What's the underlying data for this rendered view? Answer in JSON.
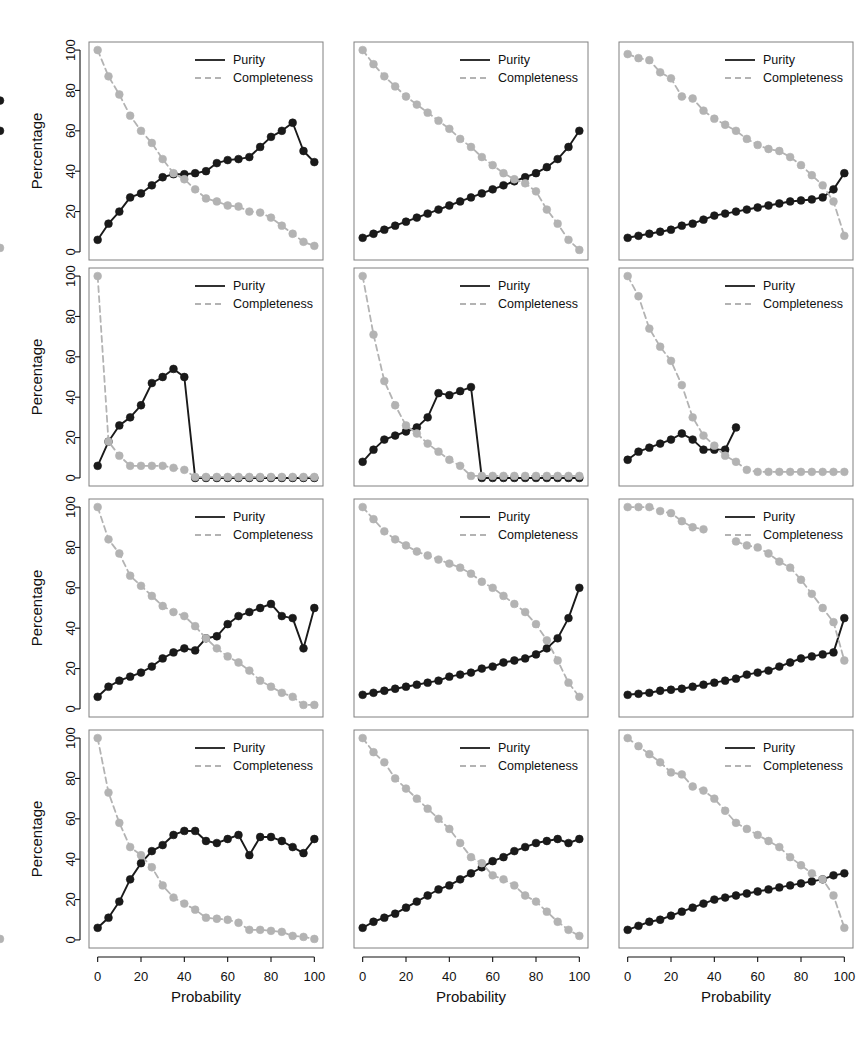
{
  "figure": {
    "rows": 4,
    "cols": 3,
    "shared_ylabel": "Percentage",
    "shared_xlabel": "Probability",
    "legend": {
      "purity_label": "Purity",
      "completeness_label": "Completeness",
      "purity_color": "#1a1a1a",
      "completeness_color": "#b3b3b3",
      "purity_style": "solid",
      "completeness_style": "dashed"
    },
    "axis": {
      "x_ticks": [
        0,
        20,
        40,
        60,
        80,
        100
      ],
      "y_ticks": [
        0,
        20,
        40,
        60,
        80,
        100
      ],
      "xlim": [
        -4,
        104
      ],
      "ylim": [
        -4,
        104
      ],
      "grid": false
    },
    "colors": {
      "background": "#ffffff",
      "frame": "#808080",
      "text": "#111111",
      "purity": "#1a1a1a",
      "completeness": "#b3b3b3"
    }
  },
  "chart_data": [
    {
      "type": "line",
      "panel": 1,
      "row": 1,
      "col": 1,
      "title": "",
      "xlabel": "",
      "ylabel": "Percentage",
      "xlim": [
        -4,
        104
      ],
      "ylim": [
        -4,
        104
      ],
      "x": [
        0,
        5,
        10,
        15,
        20,
        25,
        30,
        35,
        40,
        45,
        50,
        55,
        60,
        65,
        70,
        75,
        80,
        85,
        90,
        95,
        100
      ],
      "series": [
        {
          "name": "Purity",
          "values": [
            6,
            14,
            20,
            27,
            29,
            33,
            37,
            38.5,
            38.5,
            39,
            40,
            44,
            45.5,
            46,
            47,
            52,
            57,
            60,
            64,
            50,
            44.5,
            60
          ]
        },
        {
          "name": "Completeness",
          "values": [
            100,
            87,
            78,
            67.5,
            60,
            54,
            46,
            39,
            36,
            31,
            26.5,
            25,
            23,
            22.5,
            20,
            19.5,
            17,
            13,
            9,
            5,
            3,
            2
          ]
        }
      ],
      "legend_position": "top-right"
    },
    {
      "type": "line",
      "panel": 2,
      "row": 1,
      "col": 2,
      "title": "",
      "xlabel": "",
      "ylabel": "",
      "xlim": [
        -4,
        104
      ],
      "ylim": [
        -4,
        104
      ],
      "x": [
        0,
        5,
        10,
        15,
        20,
        25,
        30,
        35,
        40,
        45,
        50,
        55,
        60,
        65,
        70,
        75,
        80,
        85,
        90,
        95,
        100
      ],
      "series": [
        {
          "name": "Purity",
          "values": [
            7,
            9,
            11,
            13,
            15,
            17,
            19,
            21,
            23,
            25,
            27,
            29,
            31,
            33,
            35,
            37,
            39,
            42,
            46,
            52,
            60
          ]
        },
        {
          "name": "Completeness",
          "values": [
            100,
            93,
            87,
            82,
            77,
            73,
            69,
            65,
            61,
            56,
            52,
            47,
            43,
            39,
            36,
            34,
            30,
            21,
            14,
            6,
            1
          ]
        }
      ],
      "legend_position": "top-right"
    },
    {
      "type": "line",
      "panel": 3,
      "row": 1,
      "col": 3,
      "title": "",
      "xlabel": "",
      "ylabel": "",
      "xlim": [
        -4,
        104
      ],
      "ylim": [
        -4,
        104
      ],
      "x": [
        0,
        5,
        10,
        15,
        20,
        25,
        30,
        35,
        40,
        45,
        50,
        55,
        60,
        65,
        70,
        75,
        80,
        85,
        90,
        95,
        100
      ],
      "series": [
        {
          "name": "Purity",
          "values": [
            7,
            8,
            9,
            10,
            11,
            13,
            14,
            16,
            18,
            19,
            20,
            21,
            22,
            23,
            24,
            25,
            25.5,
            26,
            27,
            31,
            39,
            75
          ]
        },
        {
          "name": "Completeness",
          "values": [
            98,
            96,
            95,
            89,
            86,
            77,
            76,
            70,
            66,
            63,
            60,
            56,
            53,
            51,
            50,
            47,
            43,
            38,
            33,
            25,
            8
          ]
        }
      ],
      "legend_position": "top-right"
    },
    {
      "type": "line",
      "panel": 4,
      "row": 2,
      "col": 1,
      "title": "",
      "xlabel": "",
      "ylabel": "Percentage",
      "xlim": [
        -4,
        104
      ],
      "ylim": [
        -4,
        104
      ],
      "x": [
        0,
        5,
        10,
        15,
        20,
        25,
        30,
        35,
        40,
        45,
        50,
        55,
        60,
        65,
        70,
        75,
        80,
        85,
        90,
        95,
        100
      ],
      "series": [
        {
          "name": "Purity",
          "values": [
            6,
            18,
            26,
            30,
            36,
            47,
            50,
            54,
            50,
            0,
            0,
            0,
            0,
            0,
            0,
            0,
            0,
            0,
            0,
            0,
            0
          ]
        },
        {
          "name": "Completeness",
          "values": [
            100,
            18,
            11,
            6,
            6,
            6,
            6,
            5,
            4,
            0.5,
            0.5,
            0.5,
            0.5,
            0.5,
            0.5,
            0.5,
            0.5,
            0.5,
            0.5,
            0.5,
            0.5
          ]
        }
      ],
      "legend_position": "top-right"
    },
    {
      "type": "line",
      "panel": 5,
      "row": 2,
      "col": 2,
      "title": "",
      "xlabel": "",
      "ylabel": "",
      "xlim": [
        -4,
        104
      ],
      "ylim": [
        -4,
        104
      ],
      "x": [
        0,
        5,
        10,
        15,
        20,
        25,
        30,
        35,
        40,
        45,
        50,
        55,
        60,
        65,
        70,
        75,
        80,
        85,
        90,
        95,
        100
      ],
      "series": [
        {
          "name": "Purity",
          "values": [
            8,
            14,
            19,
            21,
            23,
            25,
            30,
            42,
            41,
            43,
            45,
            0,
            0,
            0,
            0,
            0,
            0,
            0,
            0,
            0,
            0
          ]
        },
        {
          "name": "Completeness",
          "values": [
            100,
            71,
            48,
            36,
            26,
            22,
            17,
            13,
            9,
            6,
            1,
            1,
            1,
            1,
            1,
            1,
            1,
            1,
            1,
            1,
            1
          ]
        }
      ],
      "legend_position": "top-right"
    },
    {
      "type": "line",
      "panel": 6,
      "row": 2,
      "col": 3,
      "title": "",
      "xlabel": "",
      "ylabel": "",
      "xlim": [
        -4,
        104
      ],
      "ylim": [
        -4,
        104
      ],
      "x": [
        0,
        5,
        10,
        15,
        20,
        25,
        30,
        35,
        40,
        45,
        50,
        55,
        60,
        65,
        70,
        75,
        80,
        85,
        90,
        95,
        100
      ],
      "series": [
        {
          "name": "Purity",
          "values": [
            9,
            13,
            15,
            17,
            19,
            22,
            19,
            14,
            14,
            14,
            25,
            null,
            null,
            null,
            null,
            null,
            null,
            null,
            null,
            null,
            null
          ]
        },
        {
          "name": "Completeness",
          "values": [
            100,
            90,
            74,
            65,
            58,
            46,
            30,
            21,
            16,
            11,
            8,
            4,
            3,
            3,
            3,
            3,
            3,
            3,
            3,
            3,
            3
          ]
        }
      ],
      "legend_position": "top-right"
    },
    {
      "type": "line",
      "panel": 7,
      "row": 3,
      "col": 1,
      "title": "",
      "xlabel": "",
      "ylabel": "Percentage",
      "xlim": [
        -4,
        104
      ],
      "ylim": [
        -4,
        104
      ],
      "x": [
        0,
        5,
        10,
        15,
        20,
        25,
        30,
        35,
        40,
        45,
        50,
        55,
        60,
        65,
        70,
        75,
        80,
        85,
        90,
        95,
        100
      ],
      "series": [
        {
          "name": "Purity",
          "values": [
            6,
            11,
            14,
            16,
            18,
            21,
            25,
            28,
            30,
            29,
            35,
            36,
            42,
            46,
            48,
            50,
            52,
            46,
            45,
            30,
            50
          ]
        },
        {
          "name": "Completeness",
          "values": [
            100,
            84,
            77,
            66,
            61,
            56,
            51,
            48,
            46,
            41,
            35,
            30,
            26,
            23,
            19,
            14,
            11,
            8,
            6,
            2,
            2
          ]
        }
      ],
      "legend_position": "top-right"
    },
    {
      "type": "line",
      "panel": 8,
      "row": 3,
      "col": 2,
      "title": "",
      "xlabel": "",
      "ylabel": "",
      "xlim": [
        -4,
        104
      ],
      "ylim": [
        -4,
        104
      ],
      "x": [
        0,
        5,
        10,
        15,
        20,
        25,
        30,
        35,
        40,
        45,
        50,
        55,
        60,
        65,
        70,
        75,
        80,
        85,
        90,
        95,
        100
      ],
      "series": [
        {
          "name": "Purity",
          "values": [
            7,
            8,
            9,
            10,
            11,
            12,
            13,
            14,
            16,
            17,
            18,
            20,
            21,
            23,
            24,
            25,
            27,
            30,
            35,
            45,
            60
          ]
        },
        {
          "name": "Completeness",
          "values": [
            100,
            94,
            88,
            84,
            81,
            78,
            76,
            74,
            72,
            70,
            67,
            63,
            60,
            56,
            52,
            48,
            42,
            34,
            24,
            13,
            6
          ]
        }
      ],
      "legend_position": "top-right"
    },
    {
      "type": "line",
      "panel": 9,
      "row": 3,
      "col": 3,
      "title": "",
      "xlabel": "",
      "ylabel": "",
      "xlim": [
        -4,
        104
      ],
      "ylim": [
        -4,
        104
      ],
      "x": [
        0,
        5,
        10,
        15,
        20,
        25,
        30,
        35,
        40,
        45,
        50,
        55,
        60,
        65,
        70,
        75,
        80,
        85,
        90,
        95,
        100
      ],
      "series": [
        {
          "name": "Purity",
          "values": [
            7,
            7.5,
            8,
            9,
            9.5,
            10,
            11,
            12,
            13,
            14,
            15,
            17,
            18,
            19,
            21,
            23,
            25,
            26,
            27,
            28,
            45
          ]
        },
        {
          "name": "Completeness",
          "values": [
            100,
            100,
            100,
            98,
            97,
            93,
            90,
            89,
            null,
            null,
            83,
            81,
            80,
            77,
            73,
            70,
            64,
            57,
            50,
            43,
            24
          ]
        }
      ],
      "legend_position": "top-right"
    },
    {
      "type": "line",
      "panel": 10,
      "row": 4,
      "col": 1,
      "title": "",
      "xlabel": "Probability",
      "ylabel": "Percentage",
      "xlim": [
        -4,
        104
      ],
      "ylim": [
        -4,
        104
      ],
      "x": [
        0,
        5,
        10,
        15,
        20,
        25,
        30,
        35,
        40,
        45,
        50,
        55,
        60,
        65,
        70,
        75,
        80,
        85,
        90,
        95,
        100
      ],
      "series": [
        {
          "name": "Purity",
          "values": [
            6,
            11,
            19,
            30,
            38,
            44,
            47,
            52,
            54,
            54,
            49,
            48,
            50,
            52,
            42,
            51,
            51,
            49,
            46,
            43,
            50
          ]
        },
        {
          "name": "Completeness",
          "values": [
            100,
            73,
            58,
            46,
            42,
            36,
            27,
            21,
            18,
            15,
            11,
            10.5,
            10,
            8.5,
            5,
            5,
            4.5,
            4,
            2,
            1.5,
            0.5,
            0.5
          ]
        }
      ],
      "legend_position": "top-right"
    },
    {
      "type": "line",
      "panel": 11,
      "row": 4,
      "col": 2,
      "title": "",
      "xlabel": "Probability",
      "ylabel": "",
      "xlim": [
        -4,
        104
      ],
      "ylim": [
        -4,
        104
      ],
      "x": [
        0,
        5,
        10,
        15,
        20,
        25,
        30,
        35,
        40,
        45,
        50,
        55,
        60,
        65,
        70,
        75,
        80,
        85,
        90,
        95,
        100
      ],
      "series": [
        {
          "name": "Purity",
          "values": [
            6,
            9,
            11,
            13,
            16,
            19,
            22,
            25,
            27,
            30,
            33,
            36,
            39,
            41,
            44,
            46,
            48,
            49,
            50,
            48,
            50
          ]
        },
        {
          "name": "Completeness",
          "values": [
            100,
            93,
            88,
            80,
            75,
            70,
            65,
            60,
            55,
            48,
            41,
            38,
            32,
            30,
            27,
            22,
            19,
            14,
            9,
            5,
            2
          ]
        }
      ],
      "legend_position": "top-right"
    },
    {
      "type": "line",
      "panel": 12,
      "row": 4,
      "col": 3,
      "title": "",
      "xlabel": "Probability",
      "ylabel": "",
      "xlim": [
        -4,
        104
      ],
      "ylim": [
        -4,
        104
      ],
      "x": [
        0,
        5,
        10,
        15,
        20,
        25,
        30,
        35,
        40,
        45,
        50,
        55,
        60,
        65,
        70,
        75,
        80,
        85,
        90,
        95,
        100
      ],
      "series": [
        {
          "name": "Purity",
          "values": [
            5,
            7,
            9,
            10,
            12,
            14,
            16,
            18,
            20,
            21,
            22,
            23,
            24,
            25,
            26,
            27,
            28,
            29,
            30,
            32,
            33
          ]
        },
        {
          "name": "Completeness",
          "values": [
            100,
            96,
            92,
            88,
            83,
            82,
            76,
            74,
            70,
            64,
            58,
            55,
            52,
            49,
            46,
            41,
            37,
            33,
            30,
            22,
            6
          ]
        }
      ],
      "legend_position": "top-right"
    }
  ]
}
